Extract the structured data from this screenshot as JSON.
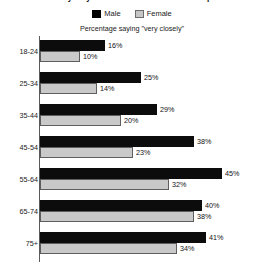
{
  "chart_data": {
    "type": "bar",
    "orientation": "horizontal",
    "title": "How closely do you follow news about national parties?",
    "subtitle": "Percentage saying \"very closely\"",
    "xlabel": "",
    "ylabel": "",
    "categories": [
      "18-24",
      "25-34",
      "35-44",
      "45-54",
      "55-64",
      "65-74",
      "75+"
    ],
    "series": [
      {
        "name": "Male",
        "color": "#000000",
        "values": [
          16,
          25,
          29,
          38,
          45,
          40,
          41
        ],
        "labels": [
          "16%",
          "25%",
          "29%",
          "38%",
          "45%",
          "40%",
          "41%"
        ]
      },
      {
        "name": "Female",
        "color": "#c9c9c9",
        "values": [
          10,
          14,
          20,
          23,
          32,
          38,
          34
        ],
        "labels": [
          "10%",
          "14%",
          "20%",
          "23%",
          "32%",
          "38%",
          "34%"
        ]
      }
    ],
    "xlim": [
      0,
      45
    ],
    "grid": false,
    "legend_position": "top",
    "value_suffix": "%"
  },
  "legend": {
    "items": [
      {
        "label": "Male",
        "swatch": "male-swatch"
      },
      {
        "label": "Female",
        "swatch": "female-swatch"
      }
    ]
  },
  "colors": {
    "male": "#000000",
    "female": "#c9c9c9",
    "axis": "#5a5a5a",
    "text": "#1a1a1a",
    "background": "#ffffff"
  }
}
